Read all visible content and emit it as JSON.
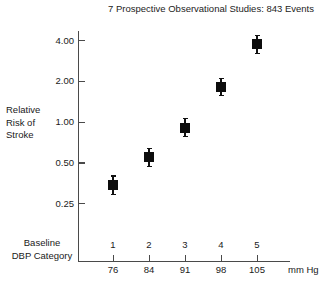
{
  "chart_data": {
    "type": "scatter",
    "title": "7 Prospective Observational Studies: 843 Events",
    "xlabel": "Baseline DBP Category",
    "ylabel": "Relative Risk of Stroke",
    "xunit": "mm Hg",
    "yscale": "log",
    "ylim": [
      0.2,
      4.8
    ],
    "yticks": [
      "0.25",
      "0.50",
      "1.00",
      "2.00",
      "4.00"
    ],
    "ytick_values": [
      0.25,
      0.5,
      1.0,
      2.0,
      4.0
    ],
    "grid": false,
    "legend": null,
    "categories": [
      "1",
      "2",
      "3",
      "4",
      "5"
    ],
    "x": [
      76,
      84,
      91,
      98,
      105
    ],
    "xtick_labels": [
      "76",
      "84",
      "91",
      "98",
      "105"
    ],
    "values": [
      0.34,
      0.55,
      0.91,
      1.82,
      3.75
    ],
    "ci_low": [
      0.29,
      0.47,
      0.78,
      1.57,
      3.2
    ],
    "ci_high": [
      0.4,
      0.64,
      1.06,
      2.1,
      4.35
    ],
    "marker": "filled-square",
    "marker_color": "#0d0d0d",
    "axis_color": "#4a4a4a"
  },
  "axis_titles": {
    "y_line1": "Relative",
    "y_line2": "Risk of",
    "y_line3": "Stroke",
    "x_line1": "Baseline",
    "x_line2": "DBP Category"
  }
}
